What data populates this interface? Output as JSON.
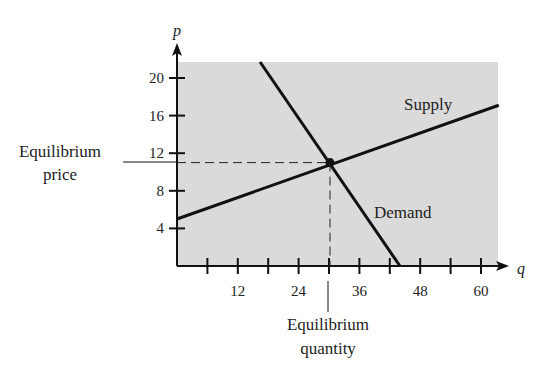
{
  "chart_data": {
    "type": "line",
    "title": "",
    "xlabel": "q",
    "ylabel": "p",
    "xlim": [
      0,
      65
    ],
    "ylim": [
      0,
      22
    ],
    "x_ticks": [
      6,
      12,
      18,
      24,
      30,
      36,
      42,
      48,
      54,
      60
    ],
    "x_tick_labels": [
      "12",
      "24",
      "36",
      "48",
      "60"
    ],
    "x_tick_label_values": [
      12,
      24,
      36,
      48,
      60
    ],
    "y_ticks": [
      4,
      8,
      12,
      16,
      20
    ],
    "y_tick_labels": [
      "4",
      "8",
      "12",
      "16",
      "20"
    ],
    "grid": false,
    "background": "#dadada",
    "series": [
      {
        "name": "Supply",
        "x": [
          0,
          63.5
        ],
        "y": [
          5,
          17.1
        ],
        "label": "Supply"
      },
      {
        "name": "Demand",
        "x": [
          16.4,
          44
        ],
        "y": [
          21.7,
          0
        ],
        "label": "Demand"
      }
    ],
    "equilibrium": {
      "q": 30,
      "p": 11
    },
    "annotations": {
      "equilibrium_price": [
        "Equilibrium",
        "price"
      ],
      "equilibrium_quantity": [
        "Equilibrium",
        "quantity"
      ],
      "supply": "Supply",
      "demand": "Demand"
    }
  }
}
